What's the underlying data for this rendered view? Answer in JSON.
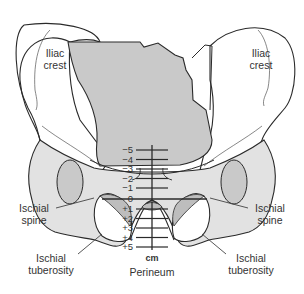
{
  "diagram": {
    "labels": {
      "iliac_crest_left": "Iliac\ncrest",
      "iliac_crest_right": "Iliac\ncrest",
      "ischial_spine_left": "Ischial\nspine",
      "ischial_spine_right": "Ischial\nspine",
      "ischial_tuberosity_left": "Ischial\ntuberosity",
      "ischial_tuberosity_right": "Ischial\ntuberosity",
      "perineum": "Perineum",
      "unit": "cm"
    },
    "scale": {
      "ticks": [
        "−5",
        "−4",
        "−3",
        "−2",
        "−1",
        "0",
        "+1",
        "+2",
        "+3",
        "+4",
        "+5"
      ]
    },
    "colors": {
      "bone_fill": "#ffffff",
      "pelvis_shade": "#e2e2e2",
      "sacrum_fill": "#c9c9c9",
      "obturator_fill": "#bdbdbd",
      "line": "#2a2a2a",
      "text": "#333333"
    }
  }
}
